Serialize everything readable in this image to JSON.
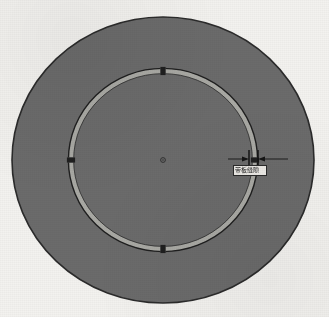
{
  "drawing": {
    "title": "Circular disc with annular groove ring",
    "background_color": "#f3f2ef",
    "disc": {
      "name": "outer-disc",
      "fill_color": "#6b6b6b",
      "stroke_color": "#2b2b2b",
      "center_x": 163,
      "center_y": 160,
      "radius_x": 151,
      "radius_y": 143
    },
    "ring": {
      "name": "annular-ring",
      "band_color": "#a9a9a4",
      "outline_color": "#1f1f1f",
      "center_x": 163,
      "center_y": 160,
      "radius_x": 92,
      "radius_y": 89,
      "band_width": 5,
      "outline_width": 1.4
    },
    "gaps": [
      {
        "name": "ring-gap-top",
        "angle_deg": 270,
        "width_deg": 3.2
      },
      {
        "name": "ring-gap-right",
        "angle_deg": 0,
        "width_deg": 3.2
      },
      {
        "name": "ring-gap-bottom",
        "angle_deg": 90,
        "width_deg": 3.2
      },
      {
        "name": "ring-gap-left",
        "angle_deg": 180,
        "width_deg": 3.2
      }
    ],
    "center_mark": {
      "name": "center-point-marker",
      "x": 163,
      "y": 160,
      "radius": 2.4,
      "color": "#2a2a2a"
    },
    "dimension": {
      "name": "ring-thickness-dimension",
      "label_text": "带板缝隙",
      "line_color": "#151515",
      "arrow_color": "#151515",
      "leader_y": 159,
      "leader_x_start": 228,
      "leader_x_end": 288,
      "extension_x_left": 249,
      "extension_x_right": 258,
      "extension_y_top": 150,
      "extension_y_bottom": 170,
      "label_x": 233,
      "label_y": 165,
      "label_width": 34,
      "label_height": 11
    }
  }
}
